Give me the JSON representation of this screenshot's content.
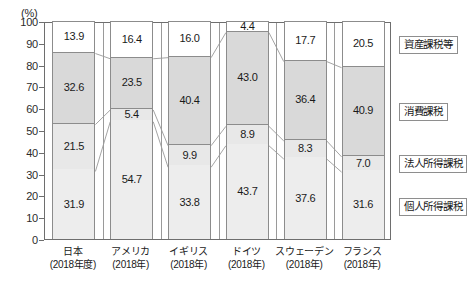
{
  "axis": {
    "unit_label": "(%)",
    "yticks": [
      "100",
      "90",
      "80",
      "70",
      "60",
      "50",
      "40",
      "30",
      "20",
      "10",
      "0"
    ]
  },
  "legend": {
    "items": [
      {
        "key": "asset",
        "label": "資産課税等"
      },
      {
        "key": "consume",
        "label": "消費課税"
      },
      {
        "key": "corporate",
        "label": "法人所得課税"
      },
      {
        "key": "income",
        "label": "個人所得課税"
      }
    ]
  },
  "categories": [
    {
      "name": "日本",
      "year": "(2018年度)"
    },
    {
      "name": "アメリカ",
      "year": "(2018年)"
    },
    {
      "name": "イギリス",
      "year": "(2018年)"
    },
    {
      "name": "ドイツ",
      "year": "(2018年)"
    },
    {
      "name": "スウェーデン",
      "year": "(2018年)"
    },
    {
      "name": "フランス",
      "year": "(2018年)"
    }
  ],
  "values": {
    "asset": [
      "13.9",
      "16.4",
      "16.0",
      "4.4",
      "17.7",
      "20.5"
    ],
    "consume": [
      "32.6",
      "23.5",
      "40.4",
      "43.0",
      "36.4",
      "40.9"
    ],
    "corporate": [
      "21.5",
      "5.4",
      "9.9",
      "8.9",
      "8.3",
      "7.0"
    ],
    "income": [
      "31.9",
      "54.7",
      "33.8",
      "43.7",
      "37.6",
      "31.6"
    ]
  },
  "colors": {
    "asset": "#ffffff",
    "consume": "#d9d9d9",
    "corporate": "#e8e8e8",
    "income": "#ededed",
    "frame": "#6e6e6e",
    "segment_border": "#8c8c8c"
  },
  "chart_data": {
    "type": "bar",
    "title": "",
    "subtitle": "",
    "xlabel": "",
    "ylabel": "(%)",
    "ylim": [
      0,
      100
    ],
    "grid": false,
    "stacked": true,
    "stack_order_bottom_to_top": [
      "個人所得課税",
      "法人所得課税",
      "消費課税",
      "資産課税等"
    ],
    "legend_position": "right",
    "categories": [
      "日本 (2018年度)",
      "アメリカ (2018年)",
      "イギリス (2018年)",
      "ドイツ (2018年)",
      "スウェーデン (2018年)",
      "フランス (2018年)"
    ],
    "ytick_labels": [
      "0",
      "10",
      "20",
      "30",
      "40",
      "50",
      "60",
      "70",
      "80",
      "90",
      "100"
    ],
    "series": [
      {
        "name": "個人所得課税",
        "values": [
          31.9,
          54.7,
          33.8,
          43.7,
          37.6,
          31.6
        ]
      },
      {
        "name": "法人所得課税",
        "values": [
          21.5,
          5.4,
          9.9,
          8.9,
          8.3,
          7.0
        ]
      },
      {
        "name": "消費課税",
        "values": [
          32.6,
          23.5,
          40.4,
          43.0,
          36.4,
          40.9
        ]
      },
      {
        "name": "資産課税等",
        "values": [
          13.9,
          16.4,
          16.0,
          4.4,
          17.7,
          20.5
        ]
      }
    ],
    "annotations": "Connector lines join matching stack boundaries between adjacent bars."
  }
}
